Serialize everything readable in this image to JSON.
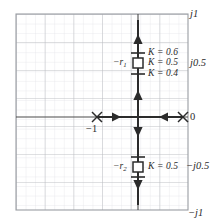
{
  "figure": {
    "kind": "root-locus-plot"
  },
  "axes": {
    "real_axis_label_left": "−1",
    "imag_labels": [
      {
        "key": "j1",
        "text": "j1"
      },
      {
        "key": "j05",
        "text": "j0.5"
      },
      {
        "key": "zero",
        "text": "0"
      },
      {
        "key": "neg_j05",
        "text": "−j0.5"
      },
      {
        "key": "neg_j1",
        "text": "−j1"
      }
    ],
    "xlim": [
      -1.5,
      0.5
    ],
    "ylim": [
      -1.143,
      1.143
    ],
    "grid": "on",
    "grid_major_step": 0.25,
    "grid_minor_per_major": 3
  },
  "poles": [
    {
      "label": "−1",
      "symbol": "x-marker",
      "re": -1.0,
      "im": 0.0
    },
    {
      "label": "0",
      "symbol": "x-marker",
      "re": 0.0,
      "im": 0.0
    }
  ],
  "markers": [
    {
      "id": "r1",
      "name": "−r",
      "sub": "1",
      "symbol": "open-square",
      "re": 0.0,
      "im": 0.63,
      "gain_labels": [
        {
          "text": "K = 0.6",
          "im": 0.75
        },
        {
          "text": "K = 0.5",
          "im": 0.63
        },
        {
          "text": "K = 0.4",
          "im": 0.51
        }
      ]
    },
    {
      "id": "r2",
      "name": "−r",
      "sub": "2",
      "symbol": "open-square",
      "re": 0.0,
      "im": -0.585,
      "gain_labels": [
        {
          "text": "K = 0.5",
          "im": -0.585
        }
      ]
    }
  ],
  "branches": [
    {
      "name": "real-axis-branch",
      "direction-arrows": [
        "right-at--0.72",
        "left-at--0.27"
      ]
    },
    {
      "name": "imag-axis-branch-upper",
      "direction-arrows": [
        "up-at-0.26",
        "up-at-0.95"
      ]
    },
    {
      "name": "imag-axis-branch-lower",
      "direction-arrows": [
        "down-at--0.21",
        "down-at--0.80"
      ]
    }
  ],
  "colors": {
    "grid_major": "#b9bcc2",
    "grid_minor": "#dcdee2",
    "axis": "#3a3a3a",
    "locus": "#2b2b2b",
    "text": "#2b2b2b",
    "background": "#ffffff"
  }
}
